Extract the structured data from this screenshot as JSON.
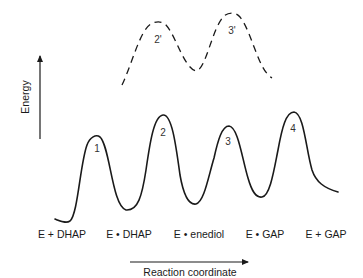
{
  "diagram": {
    "type": "reaction-energy-profile",
    "axes": {
      "y_label": "Energy",
      "x_label": "Reaction coordinate"
    },
    "states": [
      {
        "label": "E + DHAP",
        "x": 58
      },
      {
        "label": "E • DHAP",
        "x": 128
      },
      {
        "label": "E • enediol",
        "x": 197
      },
      {
        "label": "E • GAP",
        "x": 263
      },
      {
        "label": "E + GAP",
        "x": 325
      }
    ],
    "transition_states": [
      {
        "label": "1",
        "x": 97,
        "y": 149
      },
      {
        "label": "2",
        "x": 163,
        "y": 134
      },
      {
        "label": "3",
        "x": 228,
        "y": 144
      },
      {
        "label": "4",
        "x": 293,
        "y": 130
      }
    ],
    "alt_transition_states": [
      {
        "label": "2'",
        "x": 158,
        "y": 42
      },
      {
        "label": "3'",
        "x": 232,
        "y": 33
      }
    ],
    "colors": {
      "line": "#1a1a1a",
      "background": "#ffffff"
    }
  }
}
